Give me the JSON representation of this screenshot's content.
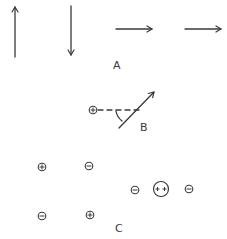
{
  "diagram": {
    "panels": [
      {
        "id": "A",
        "label": "A",
        "description": "Four field/vector arrows: up, down, right, right",
        "arrows": [
          {
            "direction": "up",
            "from": [
              15,
              57
            ],
            "to": [
              15,
              6
            ]
          },
          {
            "direction": "down",
            "from": [
              71,
              6
            ],
            "to": [
              71,
              56
            ]
          },
          {
            "direction": "right",
            "from": [
              116,
              29
            ],
            "to": [
              153,
              29
            ]
          },
          {
            "direction": "right",
            "from": [
              185,
              29
            ],
            "to": [
              222,
              29
            ]
          }
        ]
      },
      {
        "id": "B",
        "label": "B",
        "description": "Positive charge with dashed reference line and angled arrow",
        "charge": {
          "sign": "+",
          "symbol": "⊕",
          "center": [
            93,
            110
          ]
        },
        "dashed_line": {
          "from": [
            99,
            110
          ],
          "to": [
            140,
            110
          ]
        },
        "arrow": {
          "from": [
            119,
            128
          ],
          "to": [
            155,
            91
          ]
        },
        "angle_marker": true
      },
      {
        "id": "C",
        "label": "C",
        "description": "Arrangements of positive and negative charges",
        "charges": [
          {
            "sign": "+",
            "symbol": "+",
            "center": [
              42,
              167
            ],
            "size": "small"
          },
          {
            "sign": "-",
            "symbol": "−",
            "center": [
              89,
              166
            ],
            "size": "small"
          },
          {
            "sign": "-",
            "symbol": "−",
            "center": [
              42,
              216
            ],
            "size": "small"
          },
          {
            "sign": "+",
            "symbol": "+",
            "center": [
              90,
              215
            ],
            "size": "small"
          },
          {
            "sign": "-",
            "symbol": "−",
            "center": [
              135,
              190
            ],
            "size": "small"
          },
          {
            "sign": "++",
            "symbol": "++",
            "center": [
              161,
              189
            ],
            "size": "large"
          },
          {
            "sign": "-",
            "symbol": "−",
            "center": [
              189,
              189
            ],
            "size": "small"
          }
        ]
      }
    ],
    "labels": {
      "A": "A",
      "B": "B",
      "C": "C"
    },
    "colors": {
      "ink": "#3a3a3a",
      "background": "#ffffff"
    }
  }
}
